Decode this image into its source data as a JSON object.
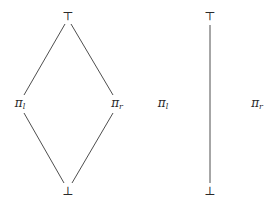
{
  "diagrams": [
    {
      "name": "diamond-lattice",
      "nodes": {
        "top": {
          "label": "⊤",
          "x": 68,
          "y": 16
        },
        "left": {
          "base": "π",
          "sub": "l",
          "x": 20,
          "y": 104
        },
        "right": {
          "base": "π",
          "sub": "r",
          "x": 117,
          "y": 104
        },
        "bottom": {
          "label": "⊥",
          "x": 68,
          "y": 191
        }
      },
      "edges": [
        [
          "top",
          "left"
        ],
        [
          "top",
          "right"
        ],
        [
          "left",
          "bottom"
        ],
        [
          "right",
          "bottom"
        ]
      ]
    },
    {
      "name": "chain-with-isolated-points",
      "nodes": {
        "top": {
          "label": "⊤",
          "x": 210,
          "y": 16
        },
        "left": {
          "base": "π",
          "sub": "l",
          "x": 163,
          "y": 104
        },
        "right": {
          "base": "π",
          "sub": "r",
          "x": 257,
          "y": 104
        },
        "bottom": {
          "label": "⊥",
          "x": 210,
          "y": 191
        }
      },
      "edges": [
        [
          "top",
          "bottom"
        ]
      ]
    }
  ]
}
